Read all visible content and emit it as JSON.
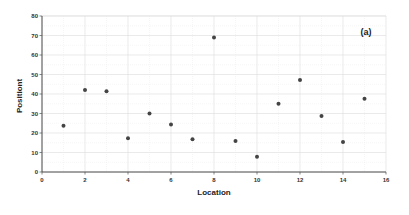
{
  "chart_data": {
    "type": "scatter",
    "title": "",
    "annotation": "(a)",
    "xlabel": "Location",
    "ylabel": "Positiont",
    "xlim": [
      0,
      16
    ],
    "ylim": [
      0,
      80
    ],
    "xticks": [
      0,
      2,
      4,
      6,
      8,
      10,
      12,
      14,
      16
    ],
    "yticks": [
      0,
      10,
      20,
      30,
      40,
      50,
      60,
      70,
      80
    ],
    "grid": true,
    "legend": null,
    "marker_color": "#444444",
    "series": [
      {
        "name": "Positiont",
        "points": [
          {
            "x": 1,
            "y": 23.7
          },
          {
            "x": 2,
            "y": 42
          },
          {
            "x": 3,
            "y": 41.4
          },
          {
            "x": 4,
            "y": 17.3
          },
          {
            "x": 5,
            "y": 30
          },
          {
            "x": 6,
            "y": 24.4
          },
          {
            "x": 7,
            "y": 16.8
          },
          {
            "x": 8,
            "y": 69
          },
          {
            "x": 9,
            "y": 15.9
          },
          {
            "x": 10,
            "y": 7.8
          },
          {
            "x": 11,
            "y": 35
          },
          {
            "x": 12,
            "y": 47.2
          },
          {
            "x": 13,
            "y": 28.7
          },
          {
            "x": 14,
            "y": 15.4
          },
          {
            "x": 15,
            "y": 37.6
          }
        ]
      }
    ]
  }
}
